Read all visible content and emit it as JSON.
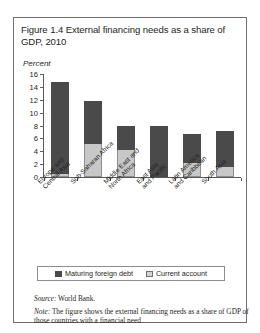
{
  "figure": {
    "title": "Figure 1.4  External financing needs as a share of GDP, 2010",
    "source_label": "Source:",
    "source_text": " World Bank.",
    "note_label": "Note:",
    "note_text": " The figure shows the external financing needs as a share of GDP of those countries with a financial need."
  },
  "colors": {
    "dark_series": "#4a4a4a",
    "light_series": "#c8c8c8",
    "axis": "#5a5a5a",
    "border": "#6f6f6f",
    "text": "#231f20"
  },
  "chart_data": {
    "type": "bar",
    "stacked": true,
    "title": "Figure 1.4  External financing needs as a share of GDP, 2010",
    "xlabel": "",
    "ylabel": "Percent",
    "ylim": [
      0,
      16
    ],
    "yticks": [
      0,
      2,
      4,
      6,
      8,
      10,
      12,
      14,
      16
    ],
    "grid": false,
    "legend_position": "bottom",
    "categories": [
      "Europe and Central Asia",
      "Sub-Saharan Africa",
      "Middle East and North Africa",
      "East Asia and Pacific",
      "Latin America and Caribbean",
      "South Asia"
    ],
    "series": [
      {
        "name": "Current account",
        "color": "#c8c8c8",
        "values": [
          0.4,
          5.1,
          4.2,
          0.0,
          2.1,
          1.6
        ]
      },
      {
        "name": "Maturing foreign debt",
        "color": "#4a4a4a",
        "values": [
          14.4,
          6.7,
          3.8,
          8.0,
          4.6,
          5.5
        ]
      }
    ],
    "totals": [
      14.8,
      11.8,
      8.0,
      8.0,
      6.7,
      7.1
    ]
  }
}
